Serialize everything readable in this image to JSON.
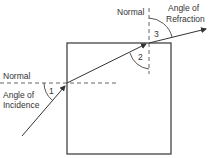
{
  "diagram": {
    "labels": {
      "normal_left": "Normal",
      "normal_top": "Normal",
      "angle_incidence_line1": "Angle of",
      "angle_incidence_line2": "Incidence",
      "angle_refraction_line1": "Angle of",
      "angle_refraction_line2": "Refraction"
    },
    "angles": {
      "angle_1": "1",
      "angle_2": "2",
      "angle_3": "3"
    },
    "colors": {
      "stroke": "#333333",
      "dash": "#555555",
      "background": "#ffffff"
    }
  }
}
